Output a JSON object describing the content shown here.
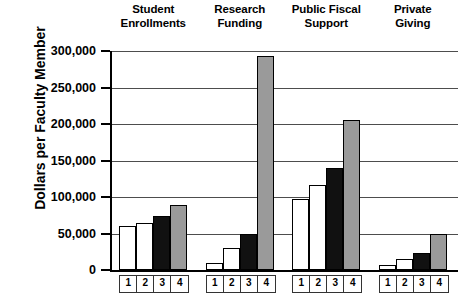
{
  "chart_data": {
    "type": "bar",
    "title": "",
    "subtitle": "",
    "xlabel": "",
    "ylabel": "Dollars per Faculty Member",
    "ylim": [
      0,
      300000
    ],
    "ytick_values": [
      300000,
      250000,
      200000,
      150000,
      100000,
      50000,
      0
    ],
    "ytick_labels": [
      "300,000",
      "250,000",
      "200,000",
      "150,000",
      "100,000",
      "50,000",
      "0"
    ],
    "grid": true,
    "legend_position": "none",
    "categories": [
      "Student Enrollments",
      "Research Funding",
      "Public Fiscal Support",
      "Private Giving"
    ],
    "category_lines": [
      [
        "Student",
        "Enrollments"
      ],
      [
        "Research",
        "Funding"
      ],
      [
        "Public Fiscal",
        "Support"
      ],
      [
        "Private",
        "Giving"
      ]
    ],
    "x_tick_labels": [
      "1",
      "2",
      "3",
      "4"
    ],
    "series": [
      {
        "name": "1",
        "fill": "#ffffff",
        "values": [
          60000,
          10000,
          97000,
          7000
        ]
      },
      {
        "name": "2",
        "fill": "#ffffff",
        "values": [
          64000,
          30000,
          116000,
          15000
        ]
      },
      {
        "name": "3",
        "fill": "#111111",
        "values": [
          74000,
          49000,
          140000,
          23000
        ]
      },
      {
        "name": "4",
        "fill": "#9a9a9a",
        "values": [
          89000,
          293000,
          205000,
          49000
        ]
      }
    ],
    "colors": {
      "axis": "#000000",
      "gridline": "#4d4d4d",
      "bar_outline": "#000000",
      "series1": "#ffffff",
      "series2": "#ffffff",
      "series3": "#111111",
      "series4": "#9a9a9a"
    }
  }
}
